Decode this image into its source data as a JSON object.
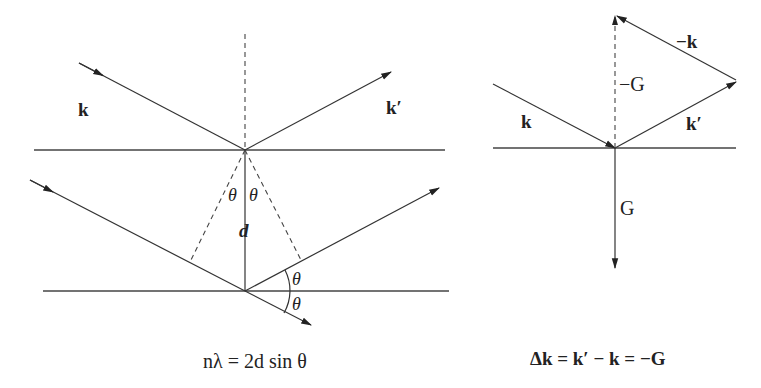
{
  "bragg": {
    "incident_label": "k",
    "scattered_label": "k′",
    "angle_label": "θ",
    "spacing_label": "d",
    "equation": "nλ = 2d sin θ"
  },
  "laue": {
    "incident_label": "k",
    "scattered_label": "k′",
    "neg_incident_label": "−k",
    "neg_G_label": "−G",
    "G_label": "G",
    "equation": "Δk = k′ − k = −G"
  }
}
